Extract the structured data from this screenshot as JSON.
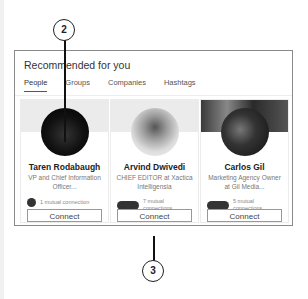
{
  "panel": {
    "title": "Recommended for you",
    "tabs": [
      {
        "label": "People",
        "active": true
      },
      {
        "label": "Groups",
        "active": false
      },
      {
        "label": "Companies",
        "active": false
      },
      {
        "label": "Hashtags",
        "active": false
      }
    ]
  },
  "cards": [
    {
      "name": "Taren Rodabaugh",
      "headline": "VP and Chief Information Officer...",
      "mutual": "1 mutual connection",
      "action": "Connect"
    },
    {
      "name": "Arvind Dwivedi",
      "headline": "CHIEF EDITOR at Xactica Intelligensia",
      "mutual": "7 mutual connections",
      "action": "Connect"
    },
    {
      "name": "Carlos Gil",
      "headline": "Marketing Agency Owner at Gil Media...",
      "mutual": "5 mutual connections",
      "action": "Connect"
    }
  ],
  "callouts": {
    "top": "2",
    "bottom": "3"
  }
}
